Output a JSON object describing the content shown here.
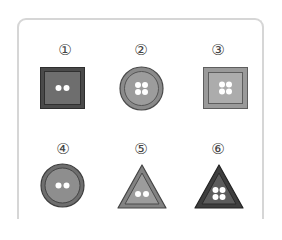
{
  "figure": {
    "items": [
      {
        "label": "①",
        "shape": "square",
        "holes": 2,
        "fill": "#6a6a6a",
        "border": "#3a3a3a"
      },
      {
        "label": "②",
        "shape": "circle",
        "holes": 4,
        "fill": "#9a9a9a",
        "border": "#555555"
      },
      {
        "label": "③",
        "shape": "square",
        "holes": 4,
        "fill": "#a8a8a8",
        "border": "#666666"
      },
      {
        "label": "④",
        "shape": "circle",
        "holes": 2,
        "fill": "#8c8c8c",
        "border": "#4a4a4a"
      },
      {
        "label": "⑤",
        "shape": "triangle",
        "holes": 2,
        "fill": "#9a9a9a",
        "border": "#4f4f4f"
      },
      {
        "label": "⑥",
        "shape": "triangle",
        "holes": 4,
        "fill": "#5a5a5a",
        "border": "#333333"
      }
    ]
  }
}
